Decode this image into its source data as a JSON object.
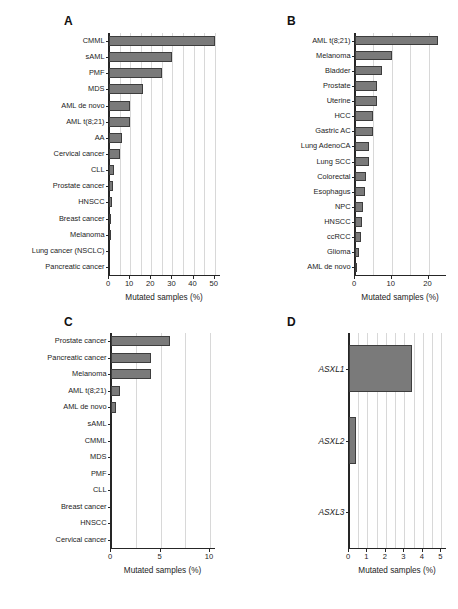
{
  "figure": {
    "background": "#ffffff",
    "bar_fill": "#7a7a7a",
    "bar_edge": "#3d3d3d",
    "grid_color": "#d8d8d8",
    "axis_color": "#262626"
  },
  "panels": {
    "a": {
      "letter": "A"
    },
    "b": {
      "letter": "B"
    },
    "c": {
      "letter": "C"
    },
    "d": {
      "letter": "D"
    }
  },
  "chart_data": [
    {
      "panel": "A",
      "type": "bar",
      "orientation": "horizontal",
      "title": "",
      "xlabel": "Mutated samples (%)",
      "ylabel": "",
      "xlim": [
        0,
        53
      ],
      "xticks": [
        0,
        10,
        20,
        30,
        40,
        50
      ],
      "xticklabels": [
        "0",
        "10",
        "20",
        "30",
        "40",
        "50"
      ],
      "grid": true,
      "legend": "none",
      "categories": [
        "CMML",
        "sAML",
        "PMF",
        "MDS",
        "AML de novo",
        "AML t(8;21)",
        "AA",
        "Cervical cancer",
        "CLL",
        "Prostate cancer",
        "HNSCC",
        "Breast cancer",
        "Melanoma",
        "Lung cancer (NSCLC)",
        "Pancreatic cancer"
      ],
      "values": [
        50,
        30,
        25,
        16,
        10,
        10,
        6,
        5,
        2.5,
        1.8,
        1.2,
        0.7,
        0.6,
        0,
        0
      ]
    },
    {
      "panel": "B",
      "type": "bar",
      "orientation": "horizontal",
      "title": "",
      "xlabel": "Mutated samples (%)",
      "ylabel": "",
      "xlim": [
        0,
        25
      ],
      "xticks": [
        0,
        10,
        20
      ],
      "xticklabels": [
        "0",
        "10",
        "20"
      ],
      "grid": true,
      "legend": "none",
      "categories": [
        "AML t(8;21)",
        "Melanoma",
        "Bladder",
        "Prostate",
        "Uterine",
        "HCC",
        "Gastric AC",
        "Lung AdenoCA",
        "Lung SCC",
        "Colorectal",
        "Esophagus",
        "NPC",
        "HNSCC",
        "ccRCC",
        "Glioma",
        "AML de novo"
      ],
      "values": [
        22.5,
        10,
        7.4,
        6.1,
        6.0,
        5.0,
        4.9,
        3.9,
        3.9,
        3.0,
        2.8,
        2.3,
        1.9,
        1.7,
        1.0,
        0.4
      ]
    },
    {
      "panel": "C",
      "type": "bar",
      "orientation": "horizontal",
      "title": "",
      "xlabel": "Mutated samples (%)",
      "ylabel": "",
      "xlim": [
        0,
        10.6
      ],
      "xticks": [
        0,
        5,
        10
      ],
      "xticklabels": [
        "0",
        "5",
        "10"
      ],
      "grid": true,
      "legend": "none",
      "categories": [
        "Prostate cancer",
        "Pancreatic cancer",
        "Melanoma",
        "AML t(8;21)",
        "AML de novo",
        "sAML",
        "CMML",
        "MDS",
        "PMF",
        "CLL",
        "Breast cancer",
        "HNSCC",
        "Cervical cancer"
      ],
      "values": [
        6.0,
        4.0,
        4.0,
        0.9,
        0.5,
        0,
        0,
        0,
        0,
        0,
        0,
        0,
        0
      ]
    },
    {
      "panel": "D",
      "type": "bar",
      "orientation": "horizontal",
      "title": "",
      "xlabel": "Mutated samples (%)",
      "ylabel": "",
      "xlim": [
        0,
        5.3
      ],
      "xticks": [
        0,
        1,
        2,
        3,
        4,
        5
      ],
      "xticklabels": [
        "0",
        "1",
        "2",
        "3",
        "4",
        "5"
      ],
      "grid": true,
      "legend": "none",
      "categories": [
        "ASXL1",
        "ASXL2",
        "ASXL3"
      ],
      "values": [
        3.4,
        0.4,
        0
      ],
      "label_style": "italic"
    }
  ]
}
